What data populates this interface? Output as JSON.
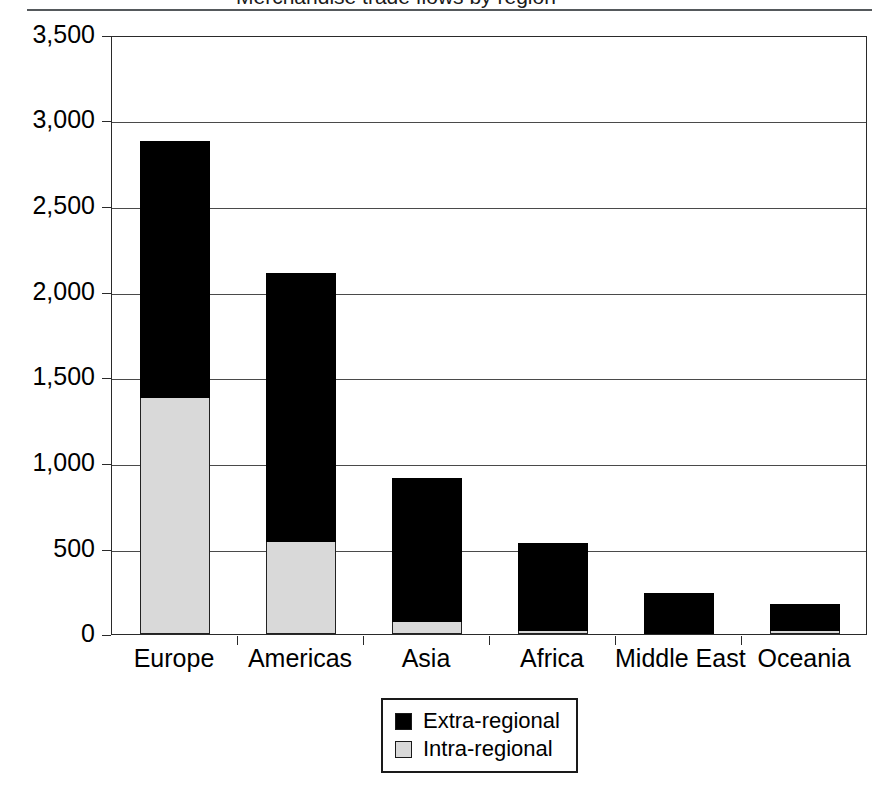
{
  "caption": {
    "text": "Merchandise trade flows by region"
  },
  "legend": {
    "position": "bottom-center",
    "entries": [
      {
        "label": "Extra-regional",
        "color": "#000000",
        "icon": "legend-swatch-extra-regional"
      },
      {
        "label": "Intra-regional",
        "color": "#d9d9d9",
        "icon": "legend-swatch-intra-regional"
      }
    ]
  },
  "axes": {
    "y_ticks": [
      "3,500",
      "3,000",
      "2,500",
      "2,000",
      "1,500",
      "1,000",
      "500",
      "0"
    ],
    "x_labels": [
      "Europe",
      "Americas",
      "Asia",
      "Africa",
      "Middle East",
      "Oceania"
    ]
  },
  "chart_data": {
    "type": "bar",
    "stacked": true,
    "title": "",
    "xlabel": "",
    "ylabel": "",
    "ylim": [
      0,
      3500
    ],
    "ytick_step": 500,
    "grid": true,
    "legend_position": "bottom-center",
    "categories": [
      "Europe",
      "Americas",
      "Asia",
      "Africa",
      "Middle East",
      "Oceania"
    ],
    "series": [
      {
        "name": "Intra-regional",
        "color": "#d9d9d9",
        "values": [
          1380,
          540,
          70,
          15,
          0,
          20
        ]
      },
      {
        "name": "Extra-regional",
        "color": "#000000",
        "values": [
          1500,
          1570,
          840,
          515,
          240,
          155
        ]
      }
    ],
    "totals": [
      2880,
      2110,
      910,
      530,
      240,
      175
    ]
  }
}
